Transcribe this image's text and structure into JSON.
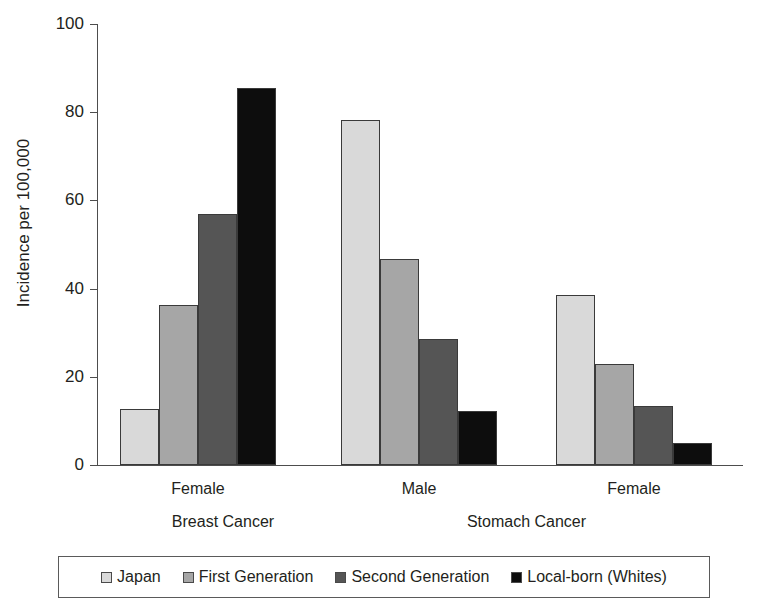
{
  "chart_data": {
    "type": "bar",
    "title": "",
    "xlabel": "",
    "ylabel": "Incidence per 100,000",
    "ylim": [
      0,
      100
    ],
    "yticks": [
      0,
      20,
      40,
      60,
      80,
      100
    ],
    "ytick_labels": [
      "0",
      "20",
      "40",
      "60",
      "80",
      "100"
    ],
    "grid": false,
    "legend_position": "bottom",
    "categories": [
      "Female",
      "Male",
      "Female"
    ],
    "category_groups": [
      "Breast Cancer",
      "Stomach Cancer"
    ],
    "group_captions": [
      {
        "sex": "Female",
        "cancer": "Breast Cancer"
      },
      {
        "sex": "Male",
        "cancer": "Stomach Cancer"
      },
      {
        "sex": "Female",
        "cancer": ""
      }
    ],
    "series": [
      {
        "name": "Japan",
        "color": "#d9d9d9",
        "values": [
          12.8,
          78.2,
          38.6
        ]
      },
      {
        "name": "First Generation",
        "color": "#a6a6a6",
        "values": [
          36.2,
          46.8,
          22.8
        ]
      },
      {
        "name": "Second Generation",
        "color": "#555555",
        "values": [
          57.0,
          28.6,
          13.3
        ]
      },
      {
        "name": "Local-born (Whites)",
        "color": "#0d0d0d",
        "values": [
          85.6,
          12.2,
          5.0
        ]
      }
    ]
  },
  "legend": {
    "items": [
      {
        "label": "Japan",
        "color": "#d9d9d9"
      },
      {
        "label": "First Generation",
        "color": "#a6a6a6"
      },
      {
        "label": "Second Generation",
        "color": "#555555"
      },
      {
        "label": "Local-born (Whites)",
        "color": "#0d0d0d"
      }
    ]
  },
  "axis": {
    "y_title": "Incidence per 100,000",
    "y_tick_labels": [
      "100",
      "80",
      "60",
      "40",
      "20",
      "0"
    ]
  },
  "x_labels": {
    "groups": [
      "Female",
      "Male",
      "Female"
    ],
    "cancers": [
      "Breast Cancer",
      "Stomach Cancer"
    ]
  }
}
